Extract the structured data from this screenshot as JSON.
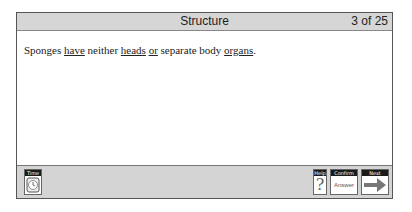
{
  "header": {
    "title": "Structure",
    "progress": "3 of 25"
  },
  "question": {
    "parts": [
      {
        "text": "Sponges ",
        "underlined": false
      },
      {
        "text": "have",
        "underlined": true
      },
      {
        "text": " neither ",
        "underlined": false
      },
      {
        "text": "heads",
        "underlined": true
      },
      {
        "text": " ",
        "underlined": false
      },
      {
        "text": "or",
        "underlined": true
      },
      {
        "text": " separate body ",
        "underlined": false
      },
      {
        "text": "organs",
        "underlined": true
      },
      {
        "text": ".",
        "underlined": false
      }
    ]
  },
  "toolbar": {
    "time_label": "Time",
    "help_label": "Help",
    "help_icon": "?",
    "confirm_label": "Confirm",
    "confirm_button_text": "Answer",
    "next_label": "Next"
  }
}
